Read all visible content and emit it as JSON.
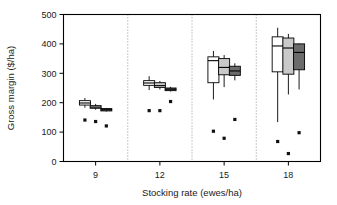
{
  "chart_data": {
    "type": "boxplot",
    "title": "",
    "xlabel": "Stocking rate (ewes/ha)",
    "ylabel": "Gross margin ($/ha)",
    "xlim": [
      7.5,
      19.5
    ],
    "ylim": [
      0,
      500
    ],
    "yticks": [
      0,
      100,
      200,
      300,
      400,
      500
    ],
    "ytick_labels": [
      "0",
      "100",
      "200",
      "300",
      "400",
      "500"
    ],
    "xticks": [
      9,
      12,
      15,
      18
    ],
    "xtick_labels": [
      "9",
      "12",
      "15",
      "18"
    ],
    "grid": false,
    "legend": "none",
    "group_separators": [
      10.5,
      13.5,
      16.5
    ],
    "series": [
      {
        "name": "series-1",
        "fill": "#ffffff",
        "boxes": [
          {
            "group": "9",
            "x": 8.5,
            "min": 183,
            "q1": 192,
            "median": 199,
            "q3": 207,
            "max": 216,
            "point": 141
          },
          {
            "group": "12",
            "x": 11.5,
            "min": 243,
            "q1": 259,
            "median": 267,
            "q3": 275,
            "max": 290,
            "point": 173
          },
          {
            "group": "15",
            "x": 14.5,
            "min": 211,
            "q1": 268,
            "median": 343,
            "q3": 356,
            "max": 376,
            "point": 103
          },
          {
            "group": "18",
            "x": 17.5,
            "min": 134,
            "q1": 305,
            "median": 393,
            "q3": 424,
            "max": 455,
            "point": 68
          }
        ]
      },
      {
        "name": "series-2",
        "fill": "#c9c9c9",
        "boxes": [
          {
            "group": "9",
            "x": 9.0,
            "min": 176,
            "q1": 181,
            "median": 185,
            "q3": 190,
            "max": 196,
            "point": 136
          },
          {
            "group": "12",
            "x": 12.0,
            "min": 245,
            "q1": 252,
            "median": 258,
            "q3": 268,
            "max": 274,
            "point": 173
          },
          {
            "group": "15",
            "x": 15.0,
            "min": 253,
            "q1": 295,
            "median": 320,
            "q3": 350,
            "max": 362,
            "point": 79
          },
          {
            "group": "18",
            "x": 18.0,
            "min": 228,
            "q1": 297,
            "median": 386,
            "q3": 420,
            "max": 434,
            "point": 27
          }
        ]
      },
      {
        "name": "series-3",
        "fill": "#6b6b6b",
        "boxes": [
          {
            "group": "9",
            "x": 9.5,
            "min": 170,
            "q1": 172,
            "median": 176,
            "q3": 180,
            "max": 182,
            "point": 121
          },
          {
            "group": "12",
            "x": 12.5,
            "min": 238,
            "q1": 241,
            "median": 246,
            "q3": 250,
            "max": 254,
            "point": 204
          },
          {
            "group": "15",
            "x": 15.5,
            "min": 276,
            "q1": 293,
            "median": 308,
            "q3": 324,
            "max": 334,
            "point": 143
          },
          {
            "group": "18",
            "x": 18.5,
            "min": 245,
            "q1": 312,
            "median": 371,
            "q3": 400,
            "max": 402,
            "point": 98
          }
        ]
      }
    ]
  },
  "colors": {
    "axis": "#000000",
    "separator": "#8a8a8a",
    "series_1_fill": "#ffffff",
    "series_2_fill": "#c9c9c9",
    "series_3_fill": "#6b6b6b",
    "marker": "#111111"
  }
}
